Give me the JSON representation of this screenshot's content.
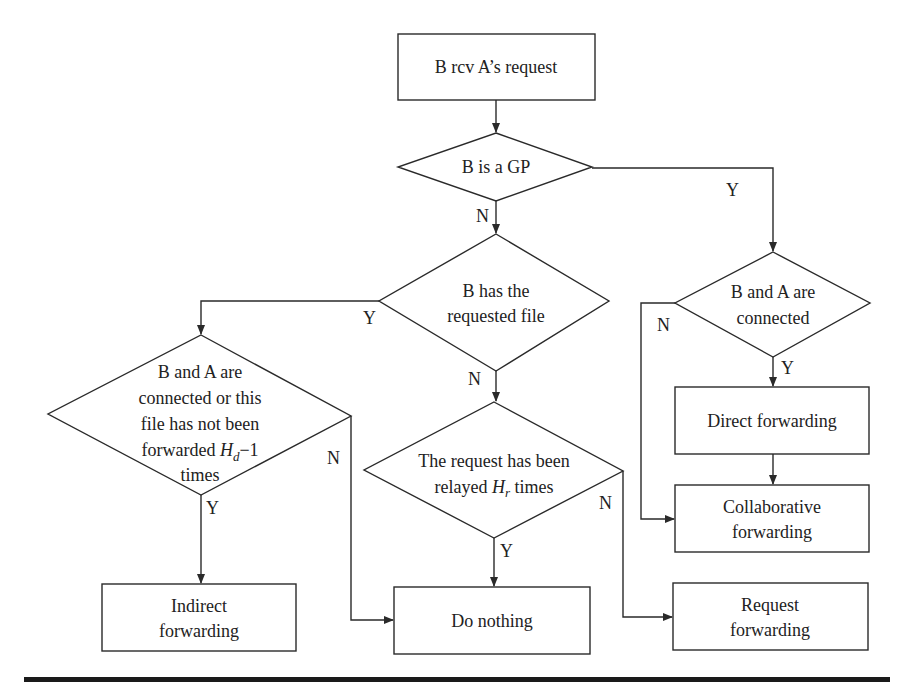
{
  "diagram": {
    "type": "flowchart",
    "nodes": {
      "start": {
        "label_lines": [
          "B rcv A’s request"
        ]
      },
      "is_gp": {
        "label_lines": [
          "B is a GP"
        ]
      },
      "has_file": {
        "label_lines": [
          "B has the",
          "requested file"
        ]
      },
      "connected_or_not_forwarded": {
        "label_lines": [
          "B and A are",
          "connected or this",
          "file has not been"
        ],
        "line4_prefix": "forwarded ",
        "line4_var": "H",
        "line4_sub": "d",
        "line4_suffix": "−1",
        "line5": "times"
      },
      "relayed": {
        "label_line1": "The request has been",
        "line2_prefix": "relayed ",
        "line2_var": "H",
        "line2_sub": "r",
        "line2_suffix": " times"
      },
      "connected": {
        "label_lines": [
          "B and A are",
          "connected"
        ]
      },
      "direct_forwarding": {
        "label_lines": [
          "Direct forwarding"
        ]
      },
      "collaborative_forwarding": {
        "label_lines": [
          "Collaborative",
          "forwarding"
        ]
      },
      "indirect_forwarding": {
        "label_lines": [
          "Indirect",
          "forwarding"
        ]
      },
      "do_nothing": {
        "label_lines": [
          "Do nothing"
        ]
      },
      "request_forwarding": {
        "label_lines": [
          "Request",
          "forwarding"
        ]
      }
    },
    "edge_labels": {
      "gp_no": "N",
      "gp_yes": "Y",
      "has_file_yes": "Y",
      "has_file_no": "N",
      "left_no": "N",
      "left_yes": "Y",
      "relayed_no": "N",
      "relayed_yes": "Y",
      "connected_no": "N",
      "connected_yes": "Y"
    },
    "colors": {
      "stroke": "#2a2a2a",
      "text": "#222222",
      "background": "#ffffff"
    }
  }
}
